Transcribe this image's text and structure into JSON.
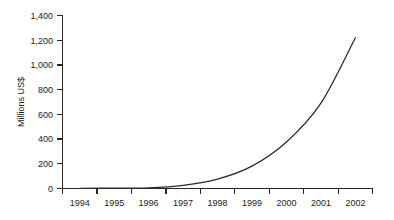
{
  "chart_data": {
    "type": "line",
    "title": "",
    "subtitle": "",
    "xlabel": "",
    "ylabel": "Millions US$",
    "categories": [
      "1994",
      "1995",
      "1996",
      "1997",
      "1998",
      "1999",
      "2000",
      "2001",
      "2002"
    ],
    "series": [
      {
        "name": "Millions US$",
        "values": [
          0,
          2,
          5,
          25,
          75,
          180,
          375,
          690,
          1220
        ],
        "color": "#2b2b2b"
      }
    ],
    "ylim": [
      0,
      1400
    ],
    "ytick_values": [
      0,
      200,
      400,
      600,
      800,
      1000,
      1200,
      1400
    ],
    "ytick_labels": [
      "0",
      "200",
      "400",
      "600",
      "800",
      "1,000",
      "1,200",
      "1,400"
    ],
    "xtick_labels": [
      "1994",
      "1995",
      "1996",
      "1997",
      "1998",
      "1999",
      "2000",
      "2001",
      "2002"
    ],
    "grid": false,
    "legend": false,
    "legend_position": "none",
    "annotations": []
  },
  "colors": {
    "line": "#2b2b2b",
    "axis": "#262626",
    "text": "#1a1a1a",
    "background": "#ffffff"
  }
}
